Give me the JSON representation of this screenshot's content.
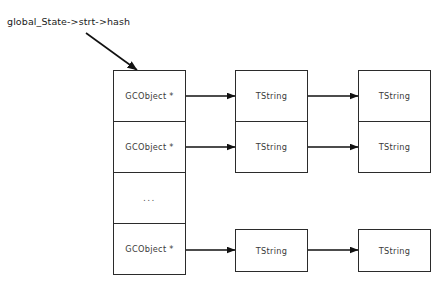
{
  "diagram": {
    "title_label": "global_State->strt->hash",
    "root_pointer_label": "global_State->strt->hash",
    "colors": {
      "background": "#ffffff",
      "box_border": "#2b2b2b",
      "arrow": "#111111",
      "text": "#3a3a3a",
      "label_text": "#1a1a1a"
    },
    "hash_table": {
      "name": "hash-table-column",
      "cells": [
        {
          "label": "GCObject *",
          "kind": "pointer"
        },
        {
          "label": "GCObject *",
          "kind": "pointer"
        },
        {
          "label": "...",
          "kind": "ellipsis"
        },
        {
          "label": "GCObject *",
          "kind": "pointer"
        }
      ]
    },
    "chains": [
      {
        "from_cell": 0,
        "nodes": [
          {
            "label": "TString"
          },
          {
            "label": "TString"
          }
        ]
      },
      {
        "from_cell": 1,
        "nodes": [
          {
            "label": "TString"
          },
          {
            "label": "TString"
          }
        ]
      },
      {
        "from_cell": 3,
        "nodes": [
          {
            "label": "TString"
          },
          {
            "label": "TString"
          }
        ]
      }
    ],
    "arrows": {
      "root_arrow": {
        "name": "root-pointer-arrow"
      },
      "link_arrow_name": "chain-link-arrow"
    }
  }
}
